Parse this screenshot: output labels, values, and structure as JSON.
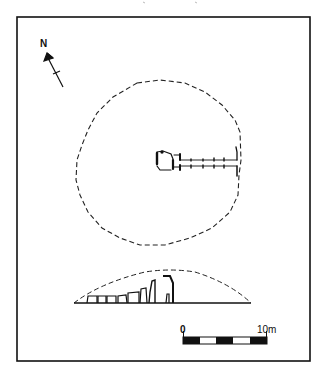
{
  "figure": {
    "north_label": "N",
    "scale": {
      "start_label": "0",
      "end_label": "10m",
      "segments": [
        "black",
        "white",
        "black",
        "white",
        "black"
      ]
    },
    "views": [
      "plan",
      "section"
    ],
    "colors": {
      "ink": "#111111",
      "paper": "#ffffff"
    }
  }
}
